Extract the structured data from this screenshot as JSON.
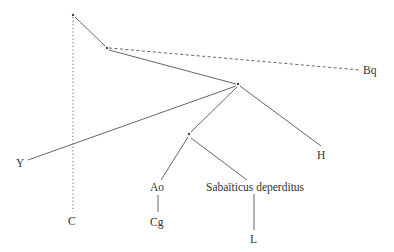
{
  "diagram": {
    "type": "stemma",
    "nodes": [
      {
        "id": "root",
        "x": 73,
        "y": 15,
        "label": ""
      },
      {
        "id": "n1",
        "x": 107,
        "y": 48,
        "label": ""
      },
      {
        "id": "n2",
        "x": 238,
        "y": 84,
        "label": ""
      },
      {
        "id": "n3",
        "x": 189,
        "y": 134,
        "label": ""
      },
      {
        "id": "Bq",
        "x": 370,
        "y": 74,
        "label": "Bq"
      },
      {
        "id": "Y",
        "x": 20,
        "y": 167,
        "label": "Y"
      },
      {
        "id": "H",
        "x": 322,
        "y": 159,
        "label": "H"
      },
      {
        "id": "C",
        "x": 73,
        "y": 225,
        "label": "C"
      },
      {
        "id": "Ao",
        "x": 157,
        "y": 191,
        "label": "Ao"
      },
      {
        "id": "Cg",
        "x": 157,
        "y": 225,
        "label": "Cg"
      },
      {
        "id": "SD",
        "x": 254,
        "y": 191,
        "label": "Sabaïticus deperditus"
      },
      {
        "id": "L",
        "x": 254,
        "y": 243,
        "label": "L"
      }
    ],
    "edges": [
      {
        "from": "root",
        "to": "C",
        "style": "dotted"
      },
      {
        "from": "root",
        "to": "n1",
        "style": "solid"
      },
      {
        "from": "n1",
        "to": "Bq",
        "style": "dashed"
      },
      {
        "from": "n1",
        "to": "n2",
        "style": "solid"
      },
      {
        "from": "n2",
        "to": "Y",
        "style": "solid"
      },
      {
        "from": "n2",
        "to": "H",
        "style": "solid"
      },
      {
        "from": "n2",
        "to": "n3",
        "style": "solid"
      },
      {
        "from": "n3",
        "to": "Ao",
        "style": "solid"
      },
      {
        "from": "n3",
        "to": "SD",
        "style": "solid"
      },
      {
        "from": "Ao",
        "to": "Cg",
        "style": "solid"
      },
      {
        "from": "SD",
        "to": "L",
        "style": "solid"
      }
    ],
    "labels": {
      "bq": "Bq",
      "y": "Y",
      "h": "H",
      "c": "C",
      "ao": "Ao",
      "cg": "Cg",
      "sabaiticus": "Sabaïticus deperditus",
      "l": "L"
    },
    "colors": {
      "line": "#555555",
      "text": "#333333",
      "background": "#ffffff"
    }
  }
}
